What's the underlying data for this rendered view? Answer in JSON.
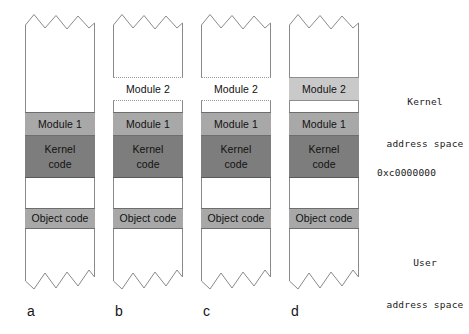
{
  "figure": {
    "type": "memory-layout-diagram",
    "band_labels": {
      "module1": "Module 1",
      "module2": "Module 2",
      "kernel_code_line1": "Kernel",
      "kernel_code_line2": "code",
      "object_code": "Object code"
    },
    "colors": {
      "module1_fill": "#a8a8a8",
      "module2_fill": "#c9c9c9",
      "kernel_code_fill": "#7d7d7d",
      "object_code_fill": "#a8a8a8",
      "empty_fill": "#ffffff",
      "outline": "#8a8a8a",
      "text": "#111111"
    },
    "columns": [
      {
        "id": "a",
        "letter": "a",
        "bands": [
          {
            "name": "module-2",
            "label": "Module 2",
            "visible": false,
            "style": "none",
            "top": 77,
            "height": 24
          },
          {
            "name": "module-1",
            "label": "Module 1",
            "visible": true,
            "style": "module1",
            "top": 112,
            "height": 24
          },
          {
            "name": "kernel-code",
            "label": "Kernel code",
            "visible": true,
            "style": "kernelcode",
            "top": 136,
            "height": 42
          },
          {
            "name": "object-code",
            "label": "Object code",
            "visible": true,
            "style": "objectcode",
            "top": 208,
            "height": 21
          }
        ]
      },
      {
        "id": "b",
        "letter": "b",
        "bands": [
          {
            "name": "module-2",
            "label": "Module 2",
            "visible": true,
            "style": "module2-empty",
            "top": 77,
            "height": 24
          },
          {
            "name": "module-1",
            "label": "Module 1",
            "visible": true,
            "style": "module1",
            "top": 112,
            "height": 24
          },
          {
            "name": "kernel-code",
            "label": "Kernel code",
            "visible": true,
            "style": "kernelcode",
            "top": 136,
            "height": 42
          },
          {
            "name": "object-code",
            "label": "Object code",
            "visible": true,
            "style": "objectcode",
            "top": 208,
            "height": 21
          }
        ]
      },
      {
        "id": "c",
        "letter": "c",
        "bands": [
          {
            "name": "module-2",
            "label": "Module 2",
            "visible": true,
            "style": "module2-empty",
            "top": 77,
            "height": 24
          },
          {
            "name": "module-1",
            "label": "Module 1",
            "visible": true,
            "style": "module1",
            "top": 112,
            "height": 24
          },
          {
            "name": "kernel-code",
            "label": "Kernel code",
            "visible": true,
            "style": "kernelcode",
            "top": 136,
            "height": 42
          },
          {
            "name": "object-code",
            "label": "Object code",
            "visible": true,
            "style": "objectcode",
            "top": 208,
            "height": 21
          }
        ]
      },
      {
        "id": "d",
        "letter": "d",
        "bands": [
          {
            "name": "module-2",
            "label": "Module 2",
            "visible": true,
            "style": "module2-filled",
            "top": 77,
            "height": 24
          },
          {
            "name": "module-1",
            "label": "Module 1",
            "visible": true,
            "style": "module1",
            "top": 112,
            "height": 24
          },
          {
            "name": "kernel-code",
            "label": "Kernel code",
            "visible": true,
            "style": "kernelcode",
            "top": 136,
            "height": 42
          },
          {
            "name": "object-code",
            "label": "Object code",
            "visible": true,
            "style": "objectcode",
            "top": 208,
            "height": 21
          }
        ]
      }
    ],
    "annotations": {
      "kernel_space_line1": "Kernel",
      "kernel_space_line2": "address space",
      "boundary_address": "0xc0000000",
      "user_space_line1": "User",
      "user_space_line2": "address space"
    }
  }
}
